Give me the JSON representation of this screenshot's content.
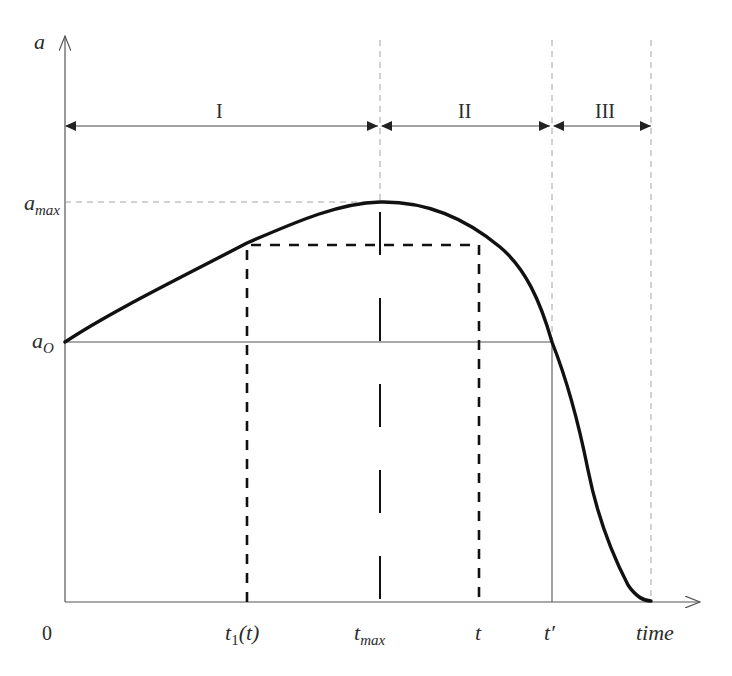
{
  "figure": {
    "type": "conceptual time-evolution diagram",
    "y_axis": {
      "label": "a"
    },
    "x_axis": {
      "label": "time",
      "origin_label": "0"
    },
    "y_levels": [
      {
        "id": "a_max",
        "base": "a",
        "sub": "max"
      },
      {
        "id": "a_0",
        "base": "a",
        "sub": "O"
      }
    ],
    "x_marks": [
      {
        "id": "t1",
        "base": "t",
        "sub": "1",
        "suffix": "(t)"
      },
      {
        "id": "t_max",
        "base": "t",
        "sub": "max"
      },
      {
        "id": "t",
        "base": "t"
      },
      {
        "id": "t_prime",
        "base": "t′"
      }
    ],
    "regions": [
      {
        "label": "I"
      },
      {
        "label": "II"
      },
      {
        "label": "III"
      }
    ],
    "curve": {
      "description": "rises from a_O at 0 to peak a_max at t_max, falls back to a_O at t', then drops to 0 near end of region III",
      "points_px": [
        [
          65,
          342
        ],
        [
          100,
          318
        ],
        [
          135,
          298
        ],
        [
          170,
          280
        ],
        [
          200,
          264
        ],
        [
          247,
          243
        ],
        [
          300,
          222
        ],
        [
          340,
          209
        ],
        [
          380,
          202
        ],
        [
          420,
          207
        ],
        [
          450,
          218
        ],
        [
          479,
          232
        ],
        [
          500,
          247
        ],
        [
          520,
          268
        ],
        [
          535,
          290
        ],
        [
          552,
          342
        ],
        [
          565,
          372
        ],
        [
          577,
          410
        ],
        [
          585,
          445
        ],
        [
          592,
          490
        ],
        [
          605,
          530
        ],
        [
          618,
          568
        ],
        [
          630,
          588
        ],
        [
          650,
          601
        ]
      ]
    },
    "colors": {
      "ink": "#111111",
      "axis": "#555555",
      "guide": "#9a9a9a"
    }
  }
}
